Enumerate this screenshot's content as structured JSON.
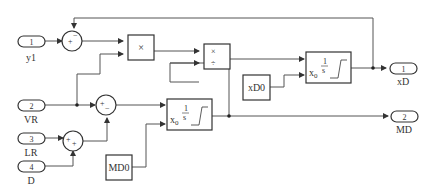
{
  "diagram": {
    "inports": [
      {
        "num": "1",
        "name": "y1"
      },
      {
        "num": "2",
        "name": "VR"
      },
      {
        "num": "3",
        "name": "LR"
      },
      {
        "num": "4",
        "name": "D"
      }
    ],
    "outports": [
      {
        "num": "1",
        "name": "xD"
      },
      {
        "num": "2",
        "name": "MD"
      }
    ],
    "sum1": {
      "signs": "+-"
    },
    "sum2": {
      "signs": "+-"
    },
    "sum3": {
      "signs": "++"
    },
    "product1": {
      "symbol": "×"
    },
    "product2": {
      "symbols": [
        "×",
        "÷"
      ]
    },
    "integrator1": {
      "x0": "x",
      "x0_sub": "0",
      "num": "1",
      "den": "s"
    },
    "integrator2": {
      "x0": "x",
      "x0_sub": "0",
      "num": "1",
      "den": "s"
    },
    "constants": [
      {
        "name": "xD0"
      },
      {
        "name": "MD0"
      }
    ]
  }
}
